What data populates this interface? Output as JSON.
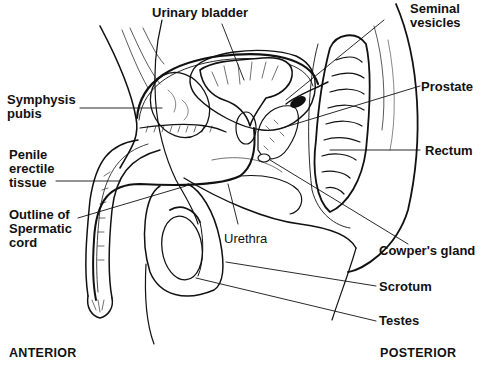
{
  "diagram": {
    "labels": {
      "urinary_bladder": "Urinary bladder",
      "seminal_vesicles": "Seminal\nvesicles",
      "symphysis_pubis": "Symphysis\npubis",
      "prostate": "Prostate",
      "penile_erectile_tissue": "Penile\nerectile\ntissue",
      "rectum": "Rectum",
      "outline_spermatic_cord": "Outline of\nSpermatic\ncord",
      "urethra": "Urethra",
      "cowpers_gland": "Cowper's gland",
      "scrotum": "Scrotum",
      "testes": "Testes"
    },
    "orientation": {
      "anterior": "ANTERIOR",
      "posterior": "POSTERIOR"
    },
    "colors": {
      "ink": "#111111",
      "background": "#ffffff"
    }
  }
}
